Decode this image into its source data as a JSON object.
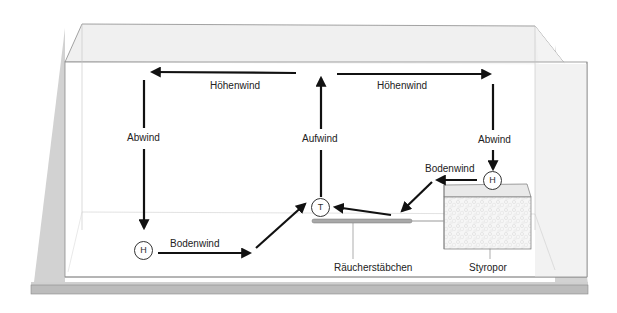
{
  "diagram": {
    "title": "",
    "labels": {
      "hoehenwind_left": "Höhenwind",
      "hoehenwind_right": "Höhenwind",
      "abwind_left": "Abwind",
      "abwind_right": "Abwind",
      "aufwind": "Aufwind",
      "bodenwind_left": "Bodenwind",
      "bodenwind_right": "Bodenwind",
      "raeucherstaebchen": "Räucherstäbchen",
      "styropor": "Styropor"
    },
    "pressure_markers": {
      "high_left": "H",
      "high_right": "H",
      "low_center": "T"
    },
    "colors": {
      "arrow": "#111111",
      "tank_edge": "#8c8c8c",
      "tank_top_fill": "#efefef",
      "base_top": "#d6d6d6",
      "base_front": "#bdbdbd",
      "styropor_fill": "#f4f4f4",
      "incense_stick": "#a8a8a8"
    }
  }
}
